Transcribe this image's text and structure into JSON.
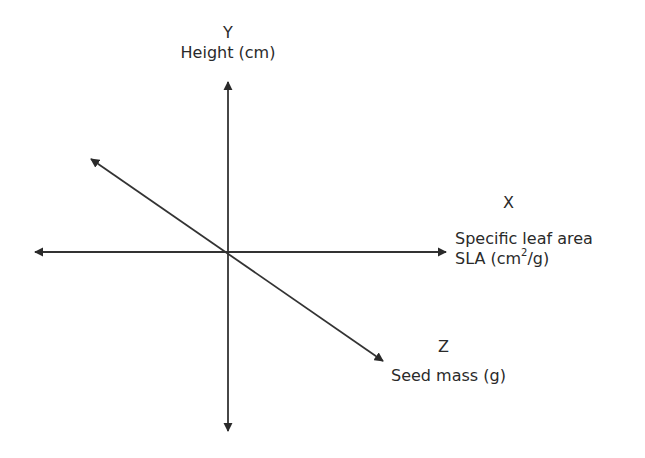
{
  "diagram": {
    "type": "three-axis trait space",
    "axes": {
      "y": {
        "letter": "Y",
        "name": "Height (cm)"
      },
      "x": {
        "letter": "X",
        "name_line1": "Specific leaf area",
        "name_line2_prefix": "SLA (cm",
        "name_line2_sup": "2",
        "name_line2_suffix": "/g)"
      },
      "z": {
        "letter": "Z",
        "name": "Seed mass (g)"
      }
    },
    "colors": {
      "line": "#333333",
      "text": "#2a2a2a",
      "background": "#ffffff"
    }
  }
}
